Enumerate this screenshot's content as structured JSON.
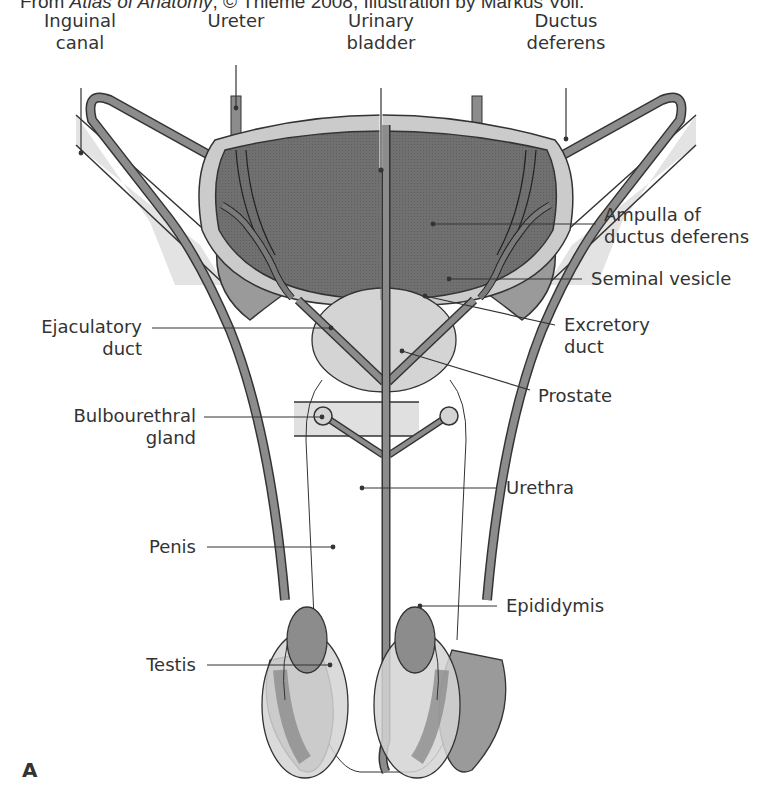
{
  "credit": {
    "prefix": "From ",
    "book": "Atlas of Anatomy",
    "suffix": ", © Thieme 2008, Illustration by Markus Voll."
  },
  "figure_label": "A",
  "colors": {
    "bladder_lumen": "#6e6e6e",
    "bladder_wall": "#c8c8c8",
    "duct": "#8c8c8c",
    "prostate": "#d4d4d4",
    "seminal_vesicle": "#9a9a9a",
    "canal": "#e2e2e2",
    "outline": "#333333"
  },
  "labels": {
    "inguinal_canal": [
      "Inguinal",
      "canal"
    ],
    "ureter": [
      "Ureter"
    ],
    "urinary_bladder": [
      "Urinary",
      "bladder"
    ],
    "ductus_deferens": [
      "Ductus",
      "deferens"
    ],
    "ampulla": [
      "Ampulla of",
      "ductus deferens"
    ],
    "seminal_vesicle": [
      "Seminal vesicle"
    ],
    "ejaculatory_duct": [
      "Ejaculatory",
      "duct"
    ],
    "excretory_duct": [
      "Excretory",
      "duct"
    ],
    "prostate": [
      "Prostate"
    ],
    "bulbourethral_gland": [
      "Bulbourethral",
      "gland"
    ],
    "urethra": [
      "Urethra"
    ],
    "penis": [
      "Penis"
    ],
    "epididymis": [
      "Epididymis"
    ],
    "testis": [
      "Testis"
    ]
  }
}
